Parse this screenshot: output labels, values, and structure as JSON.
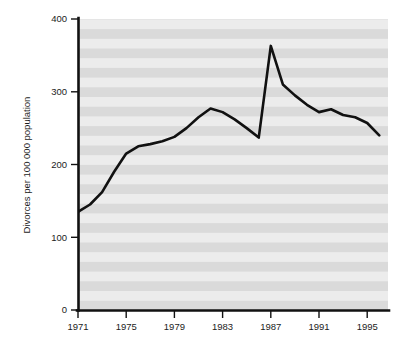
{
  "chart_data": {
    "type": "line",
    "title": "",
    "subtitle": "",
    "xlabel": "",
    "ylabel": "Divorces per 100 000 population",
    "xlim": [
      1970.5,
      1996.5
    ],
    "ylim": [
      0,
      400
    ],
    "grid": "horizontal-banded-background",
    "legend": "none",
    "x_tick_labels": [
      "1971",
      "1975",
      "1979",
      "1983",
      "1987",
      "1991",
      "1995"
    ],
    "x_tick_values": [
      1971,
      1975,
      1979,
      1983,
      1987,
      1991,
      1995
    ],
    "y_tick_labels": [
      "0",
      "100",
      "200",
      "300",
      "400"
    ],
    "y_tick_values": [
      0,
      100,
      200,
      300,
      400
    ],
    "series": [
      {
        "name": "Divorces per 100 000 population",
        "color": "#111111",
        "x": [
          1971,
          1972,
          1973,
          1974,
          1975,
          1976,
          1977,
          1978,
          1979,
          1980,
          1981,
          1982,
          1983,
          1984,
          1985,
          1986,
          1987,
          1988,
          1989,
          1990,
          1991,
          1992,
          1993,
          1994,
          1995,
          1996
        ],
        "values": [
          135,
          145,
          162,
          190,
          215,
          225,
          228,
          232,
          238,
          250,
          265,
          277,
          272,
          262,
          250,
          237,
          363,
          310,
          295,
          282,
          272,
          276,
          268,
          265,
          257,
          240
        ]
      }
    ],
    "annotations": []
  },
  "figure": {
    "background_color": "#ffffff",
    "plot_band_light": "#ebebeb",
    "plot_band_dark": "#d9d9d9",
    "axis_color": "#111111",
    "line_color": "#111111"
  }
}
